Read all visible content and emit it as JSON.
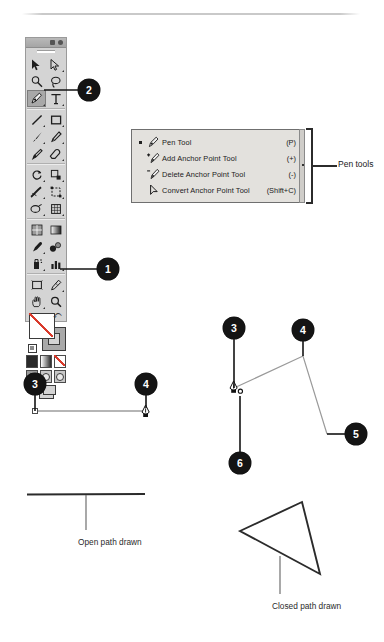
{
  "page": {
    "background": "#ffffff",
    "badge_color": "#141414",
    "panel_color": "#d4d4d4",
    "menu_color": "#e3e1dd"
  },
  "toolbox": {
    "name": "tools-panel",
    "rows": [
      [
        {
          "icon": "selection-tool",
          "has_flyout": false
        },
        {
          "icon": "direct-selection-tool",
          "has_flyout": true
        }
      ],
      [
        {
          "icon": "magic-wand-tool",
          "has_flyout": false
        },
        {
          "icon": "lasso-tool",
          "has_flyout": false
        }
      ],
      [
        {
          "icon": "pen-tool",
          "has_flyout": true,
          "selected": true
        },
        {
          "icon": "type-tool",
          "has_flyout": true
        }
      ],
      [
        {
          "icon": "line-segment-tool",
          "has_flyout": true
        },
        {
          "icon": "rectangle-tool",
          "has_flyout": true
        }
      ],
      [
        {
          "icon": "paintbrush-tool",
          "has_flyout": true
        },
        {
          "icon": "pencil-tool",
          "has_flyout": true
        }
      ],
      [
        {
          "icon": "blob-brush-tool",
          "has_flyout": false
        },
        {
          "icon": "eraser-tool",
          "has_flyout": true
        }
      ],
      [
        {
          "icon": "rotate-tool",
          "has_flyout": true
        },
        {
          "icon": "scale-tool",
          "has_flyout": true
        }
      ],
      [
        {
          "icon": "width-tool",
          "has_flyout": true
        },
        {
          "icon": "free-transform-tool",
          "has_flyout": true
        }
      ],
      [
        {
          "icon": "shape-builder-tool",
          "has_flyout": true
        },
        {
          "icon": "perspective-grid-tool",
          "has_flyout": true
        }
      ],
      [
        {
          "icon": "mesh-tool",
          "has_flyout": false
        },
        {
          "icon": "gradient-tool",
          "has_flyout": false
        }
      ],
      [
        {
          "icon": "eyedropper-tool",
          "has_flyout": true
        },
        {
          "icon": "blend-tool",
          "has_flyout": false
        }
      ],
      [
        {
          "icon": "symbol-sprayer-tool",
          "has_flyout": true
        },
        {
          "icon": "column-graph-tool",
          "has_flyout": true
        }
      ],
      [
        {
          "icon": "artboard-tool",
          "has_flyout": false
        },
        {
          "icon": "slice-tool",
          "has_flyout": true
        }
      ],
      [
        {
          "icon": "hand-tool",
          "has_flyout": true
        },
        {
          "icon": "zoom-tool",
          "has_flyout": false
        }
      ]
    ],
    "fill_stroke": {
      "fill_icon": "fill-swatch-none",
      "stroke_icon": "stroke-swatch",
      "swap_icon": "swap-fill-stroke-icon",
      "default_icon": "default-fill-stroke-icon"
    },
    "color_modes": [
      "color-swatch",
      "gradient-swatch",
      "none-swatch"
    ],
    "screen_modes": [
      "draw-normal",
      "draw-behind",
      "draw-inside"
    ],
    "screen_mode_button": "change-screen-mode"
  },
  "flyout_menu": {
    "name": "pen-tools-flyout",
    "items": [
      {
        "icon": "pen-tool-icon",
        "label": "Pen Tool",
        "shortcut": "(P)",
        "active": true
      },
      {
        "icon": "add-anchor-point-tool-icon",
        "label": "Add Anchor Point Tool",
        "shortcut": "(+)",
        "active": false
      },
      {
        "icon": "delete-anchor-point-tool-icon",
        "label": "Delete Anchor Point Tool",
        "shortcut": "(-)",
        "active": false
      },
      {
        "icon": "convert-anchor-point-tool-icon",
        "label": "Convert Anchor Point Tool",
        "shortcut": "(Shift+C)",
        "active": false
      }
    ],
    "bracket_label": "Pen tools"
  },
  "callouts": [
    {
      "id": "1",
      "number": "1",
      "target": "fill-stroke-swatch"
    },
    {
      "id": "2",
      "number": "2",
      "target": "pen-tool-button"
    },
    {
      "id": "3a",
      "number": "3",
      "target": "open-path-first-anchor"
    },
    {
      "id": "4a",
      "number": "4",
      "target": "open-path-second-anchor"
    },
    {
      "id": "3b",
      "number": "3",
      "target": "polyline-first-anchor"
    },
    {
      "id": "4b",
      "number": "4",
      "target": "polyline-second-anchor"
    },
    {
      "id": "5",
      "number": "5",
      "target": "polyline-third-anchor"
    },
    {
      "id": "6",
      "number": "6",
      "target": "close-path-cursor"
    }
  ],
  "captions": {
    "open_path": "Open path drawn",
    "closed_path": "Closed path drawn"
  },
  "drawings": {
    "open_path": {
      "name": "open-path-illustration",
      "anchor_start": [
        35,
        411
      ],
      "anchor_end": [
        146,
        411
      ],
      "cursor": "pen-tool-cursor"
    },
    "polyline_path": {
      "name": "polyline-path-illustration",
      "points": [
        [
          234,
          388
        ],
        [
          303,
          356
        ],
        [
          327,
          434
        ]
      ],
      "cursor": "pen-close-path-cursor"
    },
    "open_result": {
      "name": "open-path-result",
      "line": [
        [
          27,
          495
        ],
        [
          145,
          494
        ]
      ]
    },
    "closed_result": {
      "name": "closed-path-result",
      "points": [
        [
          240,
          531
        ],
        [
          302,
          502
        ],
        [
          320,
          574
        ]
      ]
    }
  }
}
